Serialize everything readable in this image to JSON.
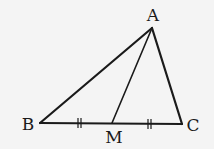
{
  "diagram": {
    "points": {
      "A": {
        "label": "A",
        "x": 152,
        "y": 28,
        "lx": 153,
        "ly": 21
      },
      "B": {
        "label": "B",
        "x": 40,
        "y": 123,
        "lx": 28,
        "ly": 130
      },
      "C": {
        "label": "C",
        "x": 182,
        "y": 124,
        "lx": 193,
        "ly": 131
      },
      "M": {
        "label": "M",
        "x": 112,
        "y": 123,
        "lx": 114,
        "ly": 143
      }
    },
    "segments": [
      "AB",
      "AC",
      "BC",
      "AM"
    ],
    "equal_marks": [
      "BM",
      "MC"
    ],
    "colors": {
      "line": "#1a1a1a",
      "background": "#f4f4f4"
    }
  }
}
